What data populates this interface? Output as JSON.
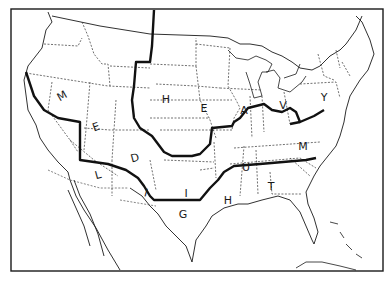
{
  "map": {
    "title": "",
    "colors": {
      "background": "#ffffff",
      "line": "#1a1a1a"
    },
    "zones": [
      {
        "name": "MEDIUM",
        "letters": [
          {
            "ch": "M",
            "x": 62,
            "y": 96,
            "rot": -30
          },
          {
            "ch": "E",
            "x": 96,
            "y": 127,
            "rot": -20
          },
          {
            "ch": "D",
            "x": 135,
            "y": 158,
            "rot": -15
          },
          {
            "ch": "I",
            "x": 146,
            "y": 193,
            "rot": 15
          },
          {
            "ch": "U",
            "x": 246,
            "y": 167,
            "rot": 0
          },
          {
            "ch": "M",
            "x": 303,
            "y": 146,
            "rot": 0
          }
        ]
      },
      {
        "name": "HEAVY",
        "letters": [
          {
            "ch": "H",
            "x": 166,
            "y": 99,
            "rot": 0
          },
          {
            "ch": "E",
            "x": 204,
            "y": 108,
            "rot": 0
          },
          {
            "ch": "A",
            "x": 244,
            "y": 110,
            "rot": 0
          },
          {
            "ch": "V",
            "x": 283,
            "y": 105,
            "rot": 0
          },
          {
            "ch": "Y",
            "x": 324,
            "y": 97,
            "rot": 0
          }
        ]
      },
      {
        "name": "LIGHT",
        "letters": [
          {
            "ch": "L",
            "x": 98,
            "y": 175,
            "rot": -15
          },
          {
            "ch": "I",
            "x": 186,
            "y": 193,
            "rot": 0
          },
          {
            "ch": "G",
            "x": 183,
            "y": 214,
            "rot": 0
          },
          {
            "ch": "H",
            "x": 228,
            "y": 200,
            "rot": 0
          },
          {
            "ch": "T",
            "x": 271,
            "y": 186,
            "rot": 0
          }
        ]
      }
    ]
  }
}
